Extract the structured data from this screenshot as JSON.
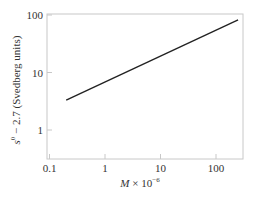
{
  "chart_data": {
    "type": "line",
    "title": "",
    "xlabel": "M × 10⁻⁶",
    "xlabel_parts": {
      "var": "M",
      "mid": " × 10",
      "sup": "−6"
    },
    "ylabel": "s⁰ − 2.7 (Svedberg units)",
    "ylabel_parts": {
      "var": "s",
      "sup": "0",
      "rest": " − 2.7 (Svedberg units)"
    },
    "xscale": "log",
    "yscale": "log",
    "xlim": [
      0.1,
      250
    ],
    "ylim": [
      0.35,
      100
    ],
    "xticks": [
      "0.1",
      "1",
      "10",
      "100"
    ],
    "yticks": [
      "1",
      "10",
      "100"
    ],
    "grid": false,
    "legend": null,
    "series": [
      {
        "name": "s0 - 2.7",
        "x": [
          0.2,
          250
        ],
        "y": [
          3.3,
          82
        ]
      }
    ]
  },
  "style": {
    "line_color": "#222222",
    "axis_color": "#bbbbbb"
  }
}
